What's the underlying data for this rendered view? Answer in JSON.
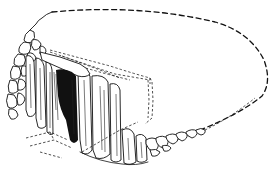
{
  "figure": {
    "colors": {
      "background": "#ffffff",
      "ink": "#111111"
    },
    "elements": {
      "cairn_outline": "dashed conjectural cairn outline",
      "chamber_outline": "dashed chamber roof outline",
      "drystone_wall": "drystone walling, left side",
      "orthostats": "upright stone slabs, front facade",
      "kerb_stones": "kerb stones along front right",
      "entrance": "dark chamber entrance",
      "ground_plan": "dotted ground plan lines, lower left"
    }
  }
}
